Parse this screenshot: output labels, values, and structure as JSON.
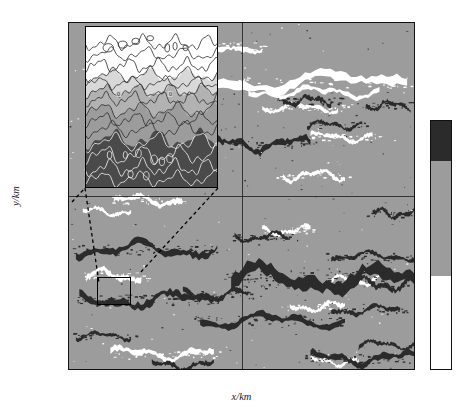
{
  "figure": {
    "axes": {
      "xlabel": "x/km",
      "ylabel": "y/km",
      "xticks": [
        "-500",
        "-400",
        "-300",
        "-200",
        "-100",
        "0",
        "100",
        "200",
        "300",
        "400",
        "500"
      ],
      "yticks": [
        "500",
        "400",
        "300",
        "200",
        "100",
        "0",
        "-100",
        "-200",
        "-300",
        "-400",
        "-500"
      ],
      "xlim": [
        -500,
        500
      ],
      "ylim": [
        -500,
        500
      ]
    },
    "colorbar": {
      "ticks": [
        "3",
        "-3",
        "-7"
      ],
      "levels": [
        -7,
        -3,
        3
      ],
      "colors": [
        "#ffffff",
        "#9c9c9c",
        "#2b2b2b"
      ]
    },
    "inset": {
      "contour_labels": [
        "0",
        "0"
      ],
      "xlim": [
        -420,
        -320
      ],
      "ylim": [
        -310,
        -230
      ]
    },
    "zoom_box": {
      "x0": -420,
      "x1": -320,
      "y0": -310,
      "y1": -230
    }
  },
  "chart_data": {
    "type": "heatmap",
    "title": "",
    "xlabel": "x/km",
    "ylabel": "y/km",
    "xlim": [
      -500,
      500
    ],
    "ylim": [
      -500,
      500
    ],
    "xticks": [
      -500,
      -400,
      -300,
      -200,
      -100,
      0,
      100,
      200,
      300,
      400,
      500
    ],
    "yticks": [
      -500,
      -400,
      -300,
      -200,
      -100,
      0,
      100,
      200,
      300,
      400,
      500
    ],
    "grid": false,
    "legend": "colorbar-right",
    "colorbar_ticks": [
      3,
      -3,
      -7
    ],
    "colorbar_levels": [
      -7,
      -3,
      3
    ],
    "colorbar_colors": [
      "#ffffff",
      "#9c9c9c",
      "#2b2b2b"
    ],
    "annotations": [
      {
        "text": "0",
        "x": -395,
        "y": 300,
        "panel": "inset"
      },
      {
        "text": "0",
        "x": -345,
        "y": 300,
        "panel": "inset"
      }
    ],
    "inset_panel": {
      "type": "contour",
      "xlim": [
        -420,
        -320
      ],
      "ylim": [
        -310,
        -230
      ],
      "contour_label": "0",
      "fill_levels": [
        "#ffffff",
        "#d8d8d8",
        "#b2b2b2",
        "#9c9c9c",
        "#4a4a4a"
      ]
    },
    "bands": [
      {
        "y_center": 430,
        "level": "white"
      },
      {
        "y_center": 330,
        "level": "white"
      },
      {
        "y_center": 255,
        "level": "dark"
      },
      {
        "y_center": 175,
        "level": "dark"
      },
      {
        "y_center": 60,
        "level": "white"
      },
      {
        "y_center": -40,
        "level": "white"
      },
      {
        "y_center": -150,
        "level": "dark"
      },
      {
        "y_center": -235,
        "level": "dark"
      },
      {
        "y_center": -300,
        "level": "dark"
      },
      {
        "y_center": -355,
        "level": "dark"
      },
      {
        "y_center": -455,
        "level": "white"
      }
    ]
  }
}
